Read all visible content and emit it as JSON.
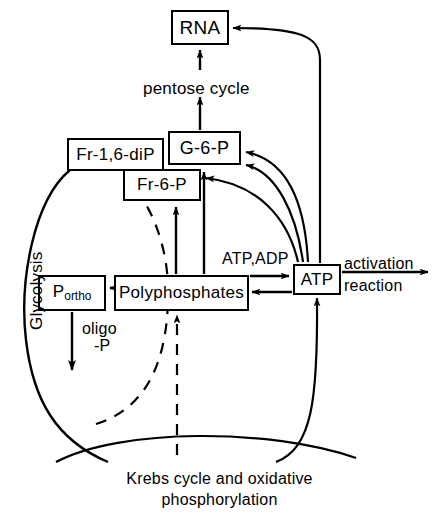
{
  "diagram": {
    "stroke_color": "#000000",
    "background_color": "#ffffff"
  },
  "nodes": {
    "rna": {
      "label": "RNA",
      "x": 171,
      "y": 10,
      "w": 58,
      "h": 35,
      "font_size": 19
    },
    "fr16dip": {
      "label": "Fr-1,6-diP",
      "x": 67,
      "y": 138,
      "w": 97,
      "h": 33,
      "font_size": 17
    },
    "g6p": {
      "label": "G-6-P",
      "x": 168,
      "y": 131,
      "w": 73,
      "h": 34,
      "font_size": 18
    },
    "fr6p": {
      "label": "Fr-6-P",
      "x": 123,
      "y": 169,
      "w": 78,
      "h": 32,
      "font_size": 17
    },
    "portho": {
      "label_main": "P",
      "label_sub": "ortho",
      "x": 38,
      "y": 275,
      "w": 68,
      "h": 36,
      "font_size": 17
    },
    "polyphosphates": {
      "label": "Polyphosphates",
      "x": 114,
      "y": 275,
      "w": 135,
      "h": 36,
      "font_size": 17
    },
    "atp": {
      "label": "ATP",
      "x": 293,
      "y": 264,
      "w": 48,
      "h": 31,
      "font_size": 17
    }
  },
  "labels": {
    "pentose_cycle": {
      "text": "pentose cycle",
      "x": 143,
      "y": 79,
      "font_size": 17
    },
    "glycolysis": {
      "text": "Glycolysis",
      "x": 27,
      "y": 330,
      "font_size": 17
    },
    "oligo_line1": {
      "text": "oligo",
      "x": 82,
      "y": 320,
      "font_size": 16
    },
    "oligo_line2": {
      "text": "-P",
      "x": 94,
      "y": 337,
      "font_size": 16
    },
    "atp_adp": {
      "text": "ATP,ADP",
      "x": 222,
      "y": 250,
      "font_size": 16
    },
    "activation": {
      "text": "activation",
      "x": 344,
      "y": 259,
      "font_size": 16
    },
    "reaction": {
      "text": "reaction",
      "x": 344,
      "y": 280,
      "font_size": 16
    },
    "krebs_line1": {
      "text": "Krebs cycle and oxidative",
      "x": 219,
      "y": 478,
      "font_size": 16
    },
    "krebs_line2": {
      "text": "phosphorylation",
      "x": 219,
      "y": 499,
      "font_size": 16
    }
  },
  "edges": [
    {
      "name": "g6p-to-pentose-to-rna",
      "from": "g6p",
      "to": "rna",
      "style": "solid",
      "arrow": "single"
    },
    {
      "name": "atp-to-rna",
      "from": "atp",
      "to": "rna",
      "style": "solid",
      "arrow": "single"
    },
    {
      "name": "atp-to-g6p-outer",
      "from": "atp",
      "to": "g6p",
      "style": "solid",
      "arrow": "single"
    },
    {
      "name": "atp-to-g6p-inner",
      "from": "atp",
      "to": "g6p",
      "style": "solid",
      "arrow": "single"
    },
    {
      "name": "atp-to-fr6p",
      "from": "atp",
      "to": "fr6p",
      "style": "solid",
      "arrow": "single"
    },
    {
      "name": "polyphosphates-to-fr6p",
      "from": "polyphosphates",
      "to": "fr6p",
      "style": "solid",
      "arrow": "single"
    },
    {
      "name": "polyphosphates-to-g6p",
      "from": "polyphosphates",
      "to": "g6p",
      "style": "solid",
      "arrow": "single"
    },
    {
      "name": "polyphosphates-to-portho",
      "from": "polyphosphates",
      "to": "portho",
      "style": "solid",
      "arrow": "single"
    },
    {
      "name": "polyphosphates-atp-exchange",
      "from": "polyphosphates",
      "to": "atp",
      "style": "solid",
      "arrow": "double"
    },
    {
      "name": "atp-to-activation-reaction",
      "from": "atp",
      "to": "activation reaction",
      "style": "solid",
      "arrow": "single"
    },
    {
      "name": "portho-to-glycolysis-loop",
      "from": "portho",
      "to": "glycolysis",
      "style": "solid",
      "arrow": "single"
    },
    {
      "name": "glycolysis-loop-to-fr16dip",
      "from": "glycolysis",
      "to": "fr16dip",
      "style": "solid",
      "arrow": "none"
    },
    {
      "name": "krebs-dashed-to-fr16dip",
      "from": "krebs cycle",
      "to": "fr16dip",
      "style": "dashed",
      "arrow": "single"
    },
    {
      "name": "krebs-dashed-to-polyphosphates",
      "from": "krebs cycle",
      "to": "polyphosphates",
      "style": "dashed",
      "arrow": "single"
    },
    {
      "name": "krebs-to-atp",
      "from": "krebs cycle",
      "to": "atp",
      "style": "solid",
      "arrow": "single"
    },
    {
      "name": "krebs-arc",
      "from": "krebs cycle",
      "to": "krebs cycle",
      "style": "solid",
      "arrow": "none"
    }
  ]
}
